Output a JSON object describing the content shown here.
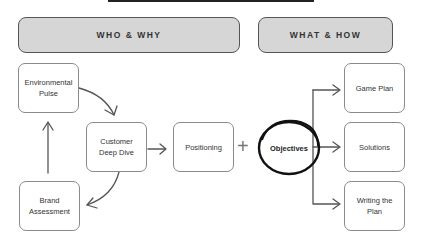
{
  "headers": {
    "left": "WHO & WHY",
    "right": "WHAT & HOW"
  },
  "nodes": {
    "environmental_pulse": "Environmental Pulse",
    "customer_deep_dive": "Customer Deep Dive",
    "brand_assessment": "Brand Assessment",
    "positioning": "Positioning",
    "plus": "+",
    "objectives": "Objectives",
    "game_plan": "Game Plan",
    "solutions": "Solutions",
    "writing_the_plan": "Writing the Plan"
  }
}
